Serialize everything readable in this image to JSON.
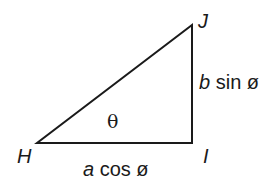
{
  "diagram": {
    "type": "right-triangle",
    "vertices": {
      "H": {
        "label": "H",
        "x": 37,
        "y": 143
      },
      "I": {
        "label": "I",
        "x": 192,
        "y": 143
      },
      "J": {
        "label": "J",
        "x": 192,
        "y": 25
      }
    },
    "sides": {
      "HI": {
        "var": "a",
        "fn": "cos ø"
      },
      "IJ": {
        "var": "b",
        "fn": "sin ø"
      }
    },
    "angle": {
      "label": "θ",
      "at": "H"
    },
    "stroke_color": "#1a1a1a"
  }
}
